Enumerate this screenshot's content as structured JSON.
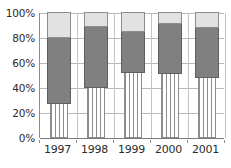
{
  "chart_data": {
    "type": "bar",
    "subtype": "stacked-percentage",
    "title": "",
    "xlabel": "",
    "ylabel": "",
    "categories": [
      "1997",
      "1998",
      "1999",
      "2000",
      "2001"
    ],
    "ylim": [
      0,
      100
    ],
    "y_ticks": [
      0,
      20,
      40,
      60,
      80,
      100
    ],
    "y_tick_labels": [
      "0%",
      "20%",
      "40%",
      "60%",
      "80%",
      "100%"
    ],
    "grid": true,
    "legend": "none",
    "series": [
      {
        "name": "bottom-segment",
        "fill": "white-vertical-hatch",
        "color": "#ffffff",
        "values": [
          27,
          40,
          52,
          51,
          48
        ]
      },
      {
        "name": "middle-segment",
        "fill": "solid",
        "color": "#808080",
        "values": [
          53,
          49,
          33,
          40,
          40
        ]
      },
      {
        "name": "top-segment",
        "fill": "solid",
        "color": "#e2e2e2",
        "values": [
          20,
          11,
          15,
          9,
          12
        ]
      }
    ],
    "cumulative_tops": [
      [
        27,
        80,
        100
      ],
      [
        40,
        89,
        100
      ],
      [
        52,
        85,
        100
      ],
      [
        51,
        91,
        100
      ],
      [
        48,
        88,
        100
      ]
    ]
  },
  "colors": {
    "bottom_segment": "#ffffff",
    "middle_segment": "#808080",
    "top_segment": "#e2e2e2",
    "gridline": "#b9b9b9",
    "axis": "#8c8c8c",
    "text": "#2b2b2b",
    "background": "#ffffff"
  }
}
